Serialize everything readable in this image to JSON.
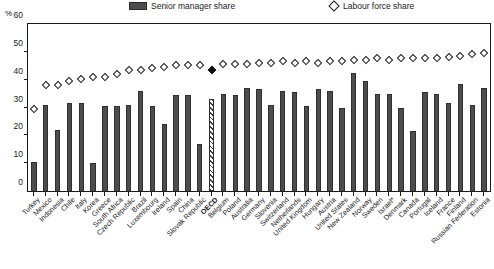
{
  "axis": {
    "unit": "%",
    "yticks": [
      0,
      10,
      20,
      30,
      40,
      50,
      60
    ]
  },
  "legend": {
    "bar_label": "Senior manager share",
    "diamond_label": "Labour force share"
  },
  "chart_data": {
    "type": "bar",
    "title": "",
    "xlabel": "",
    "ylabel": "%",
    "ylim": [
      0,
      60
    ],
    "grid": false,
    "legend_position": "top",
    "highlight_category": "OECD",
    "categories": [
      "Turkey",
      "Mexico",
      "Indonesia",
      "Chile",
      "Italy",
      "Korea",
      "Greece",
      "South Africa",
      "Czech Republic",
      "Brazil",
      "Luxembourg",
      "Ireland",
      "Spain",
      "China",
      "Slovak Republic",
      "OECD",
      "Belgium",
      "Poland",
      "Australia",
      "Germany",
      "Slovenia",
      "Switzerland",
      "Netherlands",
      "United Kingdom",
      "Hungary",
      "Austria",
      "United States",
      "New Zealand",
      "Norway",
      "Sweden",
      "Israel*",
      "Denmark",
      "Canada",
      "Portugal",
      "Iceland",
      "France",
      "Finland",
      "Russian Federation",
      "Estonia"
    ],
    "series": [
      {
        "name": "Senior manager share",
        "type": "bar",
        "values": [
          10.5,
          31.0,
          22.0,
          31.5,
          31.5,
          10.0,
          30.5,
          30.5,
          31.0,
          36.0,
          30.5,
          24.0,
          34.5,
          34.5,
          17.0,
          33.0,
          35.0,
          34.5,
          37.0,
          36.5,
          31.0,
          36.0,
          35.5,
          30.5,
          36.5,
          36.0,
          30.0,
          42.5,
          39.5,
          35.0,
          35.0,
          30.0,
          21.5,
          35.5,
          35.0,
          31.5,
          38.5,
          31.0,
          37.0
        ]
      },
      {
        "name": "Labour force share",
        "type": "scatter",
        "marker": "diamond",
        "values": [
          29.5,
          38.0,
          38.0,
          39.5,
          40.0,
          41.0,
          41.0,
          42.0,
          43.5,
          43.5,
          44.0,
          44.5,
          45.0,
          45.0,
          45.0,
          43.5,
          45.5,
          45.5,
          45.5,
          46.0,
          46.0,
          46.5,
          46.0,
          46.5,
          46.0,
          46.5,
          46.5,
          47.0,
          47.0,
          47.5,
          47.0,
          47.5,
          47.5,
          47.5,
          47.5,
          48.0,
          48.5,
          49.0,
          49.5
        ]
      }
    ]
  }
}
